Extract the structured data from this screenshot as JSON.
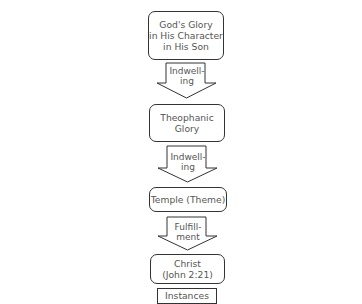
{
  "diagram": {
    "type": "vertical-flowchart",
    "nodes": [
      {
        "id": "n1",
        "label": "God's Glory\nin His Character\nin His Son"
      },
      {
        "id": "n2",
        "label": "Theophanic\nGlory"
      },
      {
        "id": "n3",
        "label": "Temple (Theme)"
      },
      {
        "id": "n4",
        "label": "Christ\n(John 2:21)"
      },
      {
        "id": "n5",
        "label": "Instances"
      }
    ],
    "arrows": [
      {
        "from": "n1",
        "to": "n2",
        "label": "Indwell-\ning"
      },
      {
        "from": "n2",
        "to": "n3",
        "label": "Indwell-\ning"
      },
      {
        "from": "n3",
        "to": "n4",
        "label": "Fulfill-\nment"
      }
    ],
    "colors": {
      "stroke": "#333333",
      "text": "#555555",
      "background": "#ffffff"
    }
  }
}
